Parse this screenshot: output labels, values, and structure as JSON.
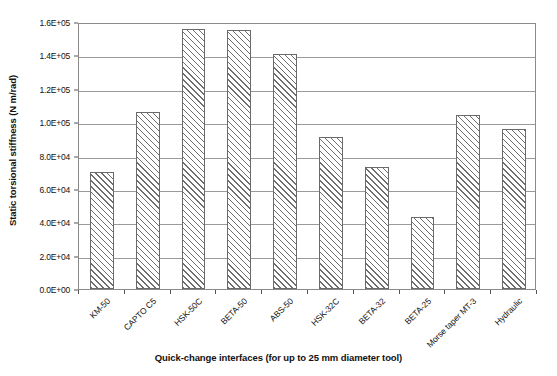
{
  "chart_data": {
    "type": "bar",
    "title": "",
    "xlabel": "Quick-change interfaces (for up to 25 mm diameter tool)",
    "ylabel": "Static torsional stiffness (N m/rad)",
    "ylim": [
      0,
      160000
    ],
    "ytick_values": [
      0,
      20000,
      40000,
      60000,
      80000,
      100000,
      120000,
      140000,
      160000
    ],
    "ytick_labels": [
      "0.0E+00",
      "2.0E+04",
      "4.0E+04",
      "6.0E+04",
      "8.0E+04",
      "1.0E+05",
      "1.2E+05",
      "1.4E+05",
      "1.6E+05"
    ],
    "grid": true,
    "legend": null,
    "categories": [
      "KM-50",
      "CAPTO C5",
      "HSK-50C",
      "BETA-50",
      "ABS-50",
      "HSK-32C",
      "BETA-32",
      "BETA-25",
      "Morse taper MT-3",
      "Hydraulic"
    ],
    "values": [
      70000,
      106000,
      156000,
      155000,
      141000,
      91000,
      73000,
      43000,
      104000,
      96000
    ],
    "series": [
      {
        "name": "Static torsional stiffness",
        "values": [
          70000,
          106000,
          156000,
          155000,
          141000,
          91000,
          73000,
          43000,
          104000,
          96000
        ],
        "fill": "hatch-diagonal",
        "edge_color": "#6a6a6a"
      }
    ]
  }
}
